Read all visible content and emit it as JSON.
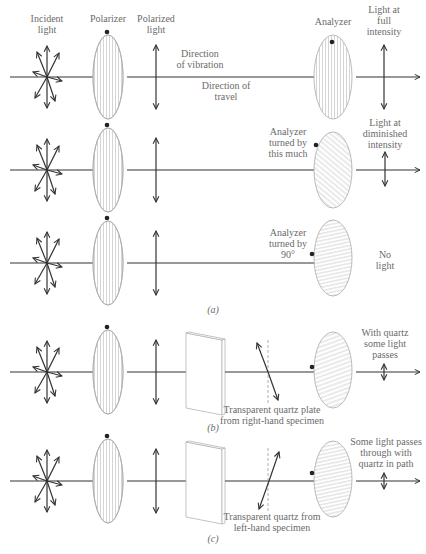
{
  "figure": {
    "panel_a": {
      "caption": "(a)",
      "headers": {
        "incident": [
          "Incident",
          "light"
        ],
        "polarizer": "Polarizer",
        "polarized": [
          "Polarized",
          "light"
        ],
        "analyzer": "Analyzer",
        "full": [
          "Light at",
          "full",
          "intensity"
        ]
      },
      "annotations": {
        "vibration": [
          "Direction",
          "of vibration"
        ],
        "travel": [
          "Direction of",
          "travel"
        ]
      },
      "row2": {
        "analyzer_label": [
          "Analyzer",
          "turned by",
          "this much"
        ],
        "result": [
          "Light at",
          "diminished",
          "intensity"
        ]
      },
      "row3": {
        "analyzer_label": [
          "Analyzer",
          "turned by",
          "90°"
        ],
        "result": [
          "No",
          "light"
        ]
      }
    },
    "panel_b": {
      "caption": "(b)",
      "quartz_label": [
        "Transparent quartz plate",
        "from right-hand specimen"
      ],
      "result": [
        "With quartz",
        "some light",
        "passes"
      ]
    },
    "panel_c": {
      "caption": "(c)",
      "quartz_label": [
        "Transparent quartz from",
        "left-hand specimen"
      ],
      "result": [
        "Some light passes",
        "through with",
        "quartz in path"
      ]
    }
  },
  "colors": {
    "line": "#333333",
    "text": "#6a6a6a",
    "hatch": "#b8b8b8",
    "background": "#ffffff"
  }
}
